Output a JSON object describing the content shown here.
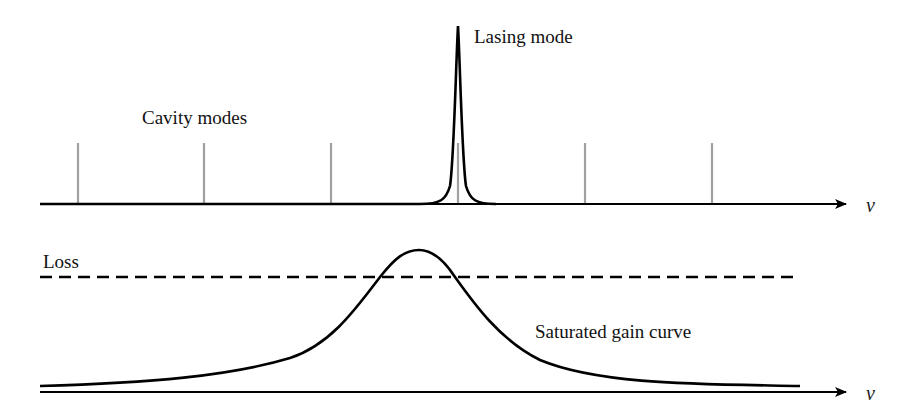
{
  "top_panel": {
    "cavity_modes_label": "Cavity modes",
    "lasing_mode_label": "Lasing mode",
    "axis_label": "ν",
    "cavity_mode_positions_px": [
      78,
      204,
      331,
      458,
      585,
      712
    ],
    "lasing_mode_position_px": 458
  },
  "bottom_panel": {
    "loss_label": "Loss",
    "gain_curve_label": "Saturated gain curve",
    "axis_label": "ν"
  },
  "colors": {
    "curve": "#000000",
    "cavity_mode": "#a0a0a0",
    "text": "#111111"
  }
}
